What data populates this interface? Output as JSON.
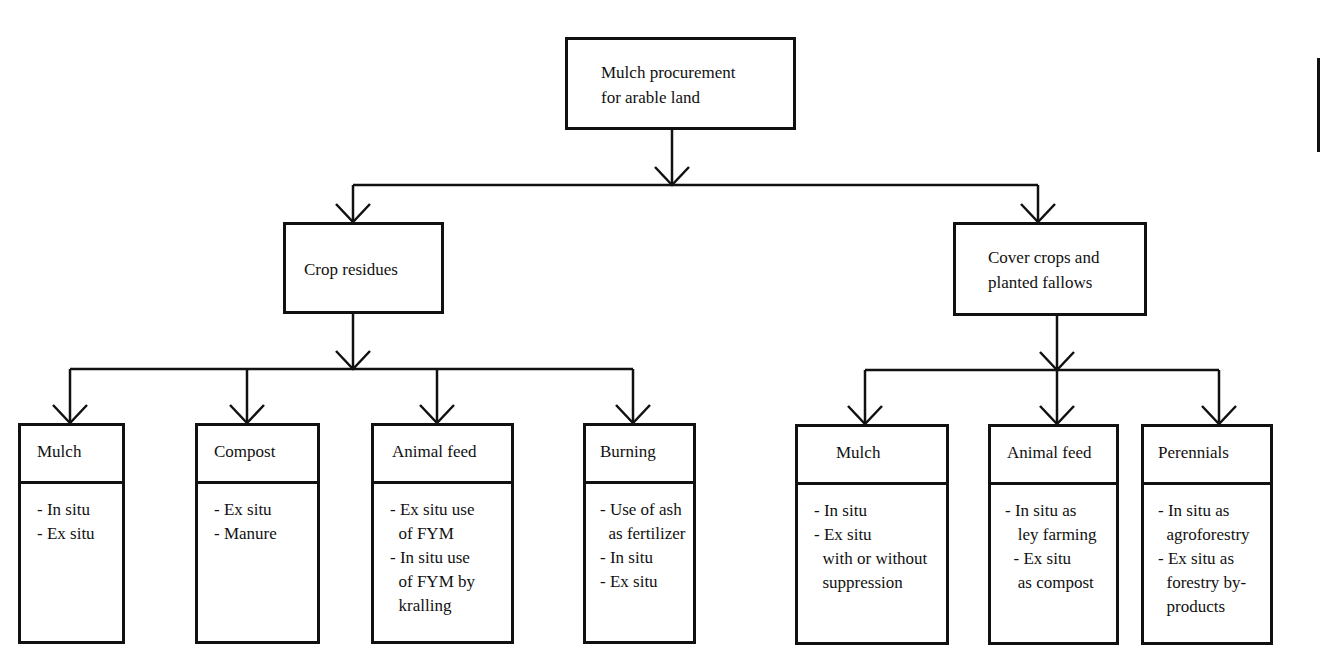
{
  "diagram": {
    "title": "Mulch procurement for arable land",
    "root": {
      "label_lines": [
        "Mulch procurement",
        "for arable land"
      ]
    },
    "branches": [
      {
        "label_lines": [
          "Crop residues"
        ],
        "children": [
          {
            "title": "Mulch",
            "items": [
              "- In situ",
              "- Ex situ"
            ]
          },
          {
            "title": "Compost",
            "items": [
              "- Ex situ",
              "- Manure"
            ]
          },
          {
            "title": "Animal feed",
            "items": [
              "- Ex situ use",
              "  of FYM",
              "- In situ use",
              "  of FYM by",
              "  kralling"
            ]
          },
          {
            "title": "Burning",
            "items": [
              "- Use of ash",
              "  as fertilizer",
              "- In situ",
              "- Ex situ"
            ]
          }
        ]
      },
      {
        "label_lines": [
          "Cover crops and",
          "planted fallows"
        ],
        "children": [
          {
            "title": "Mulch",
            "items": [
              "- In situ",
              "- Ex situ",
              "  with or without",
              "  suppression"
            ]
          },
          {
            "title": "Animal feed",
            "items": [
              "- In situ as",
              "   ley farming",
              "  - Ex situ",
              "   as compost"
            ]
          },
          {
            "title": "Perennials",
            "items": [
              "- In situ as",
              "  agroforestry",
              "- Ex situ as",
              "  forestry by-",
              "  products"
            ]
          }
        ]
      }
    ],
    "colors": {
      "line": "#111111",
      "background": "#ffffff"
    }
  }
}
